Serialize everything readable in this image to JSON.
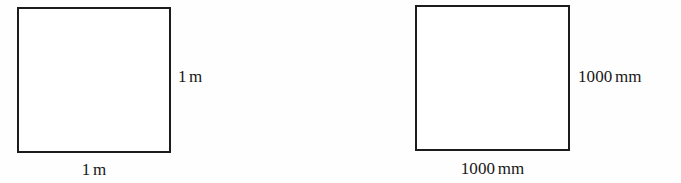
{
  "figure": {
    "background_color": "#fefefe",
    "stroke_color": "#1c1c1c",
    "text_color": "#171717"
  },
  "shapes": [
    {
      "id": "square-meter",
      "name": "square-meter",
      "labels": {
        "right": "1 m",
        "bottom": "1 m",
        "value": "1",
        "unit": "m"
      }
    },
    {
      "id": "square-millimeter",
      "name": "square-millimeter",
      "labels": {
        "right": "1000 mm",
        "bottom": "1000 mm",
        "value": "1000",
        "unit": "mm"
      }
    }
  ],
  "labels": {
    "meter_side_right": "1 m",
    "meter_side_bottom": "1 m",
    "millimeter_side_right": "1000 mm",
    "millimeter_side_bottom": "1000 mm"
  }
}
